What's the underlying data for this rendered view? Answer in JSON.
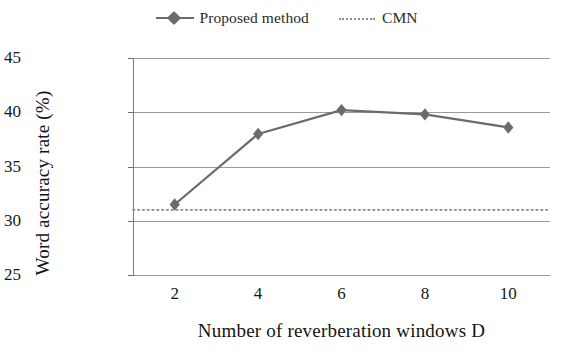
{
  "chart_data": {
    "type": "line",
    "title": "",
    "xlabel": "Number of reverberation windows D",
    "ylabel": "Word accuracy rate (%)",
    "x": [
      2,
      4,
      6,
      8,
      10
    ],
    "xticklabels": [
      "2",
      "4",
      "6",
      "8",
      "10"
    ],
    "yticklabels": [
      "25",
      "30",
      "35",
      "40",
      "45"
    ],
    "yticks": [
      25,
      30,
      35,
      40,
      45
    ],
    "xlim": [
      1,
      11
    ],
    "ylim": [
      25,
      45
    ],
    "grid": "horizontal",
    "legend_position": "top-center",
    "series": [
      {
        "name": "Proposed method",
        "marker": "diamond",
        "linestyle": "solid",
        "color": "#6b6b6b",
        "values": [
          31.5,
          38.0,
          40.2,
          39.8,
          38.6
        ]
      },
      {
        "name": "CMN",
        "marker": "none",
        "linestyle": "dotted",
        "color": "#8a8a8a",
        "constant": 31.0,
        "values": [
          31.0,
          31.0,
          31.0,
          31.0,
          31.0
        ]
      }
    ]
  },
  "legend": {
    "entries": [
      {
        "label": "Proposed method",
        "key": "line-with-diamond-marker"
      },
      {
        "label": "CMN",
        "key": "dotted-line"
      }
    ]
  },
  "axes": {
    "y_title": "Word accuracy rate (%)",
    "x_title": "Number of reverberation windows D"
  }
}
